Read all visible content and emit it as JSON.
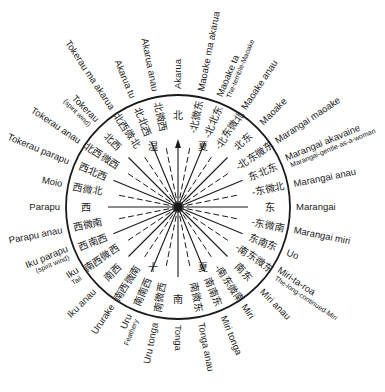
{
  "diagram": {
    "type": "compass-rose",
    "center": {
      "x": 178,
      "y": 207
    },
    "radius": 112,
    "north_arrow": "north-arrow-icon",
    "colors": {
      "ink": "#1a1a1a",
      "background": "#ffffff"
    },
    "points": [
      {
        "angle": 0,
        "cn": "北",
        "mn": "Akarua",
        "sub": ""
      },
      {
        "angle": 11.25,
        "cn": "-北微东",
        "mn": "Maoake ma akarua",
        "sub": ""
      },
      {
        "angle": 22.5,
        "cn": "-北北东",
        "mn": "Maoake ta",
        "sub": "The-terrible-Maoake"
      },
      {
        "angle": 33.75,
        "cn": "-北东微北",
        "mn": "Maoake anau",
        "sub": ""
      },
      {
        "angle": 45,
        "cn": "北东",
        "mn": "Maoake",
        "sub": ""
      },
      {
        "angle": 56.25,
        "cn": "-北东微东",
        "mn": "Marangai maoake",
        "sub": ""
      },
      {
        "angle": 67.5,
        "cn": "东北东",
        "mn": "Marangai akavaine",
        "sub": "Marangai-gentle-as-a-woman"
      },
      {
        "angle": 78.75,
        "cn": "-东微北",
        "mn": "Marangai anau",
        "sub": ""
      },
      {
        "angle": 90,
        "cn": "东",
        "mn": "Marangai",
        "sub": ""
      },
      {
        "angle": 101.25,
        "cn": "-东微南",
        "mn": "Marangai miri",
        "sub": ""
      },
      {
        "angle": 112.5,
        "cn": "东南东",
        "mn": "Uo",
        "sub": ""
      },
      {
        "angle": 123.75,
        "cn": "-南东微东",
        "mn": "Miri-ta-roa",
        "sub": "The-long-continued-Miri"
      },
      {
        "angle": 135,
        "cn": "南东",
        "mn": "Miri anau",
        "sub": ""
      },
      {
        "angle": 146.25,
        "cn": "-南东微南",
        "mn": "Miri",
        "sub": ""
      },
      {
        "angle": 157.5,
        "cn": "南南东",
        "mn": "Miri tonga",
        "sub": ""
      },
      {
        "angle": 168.75,
        "cn": "南微东",
        "mn": "Tonga anau",
        "sub": ""
      },
      {
        "angle": 180,
        "cn": "南",
        "mn": "Tonga",
        "sub": ""
      },
      {
        "angle": 191.25,
        "cn": "南微西",
        "mn": "Uru tonga",
        "sub": ""
      },
      {
        "angle": 202.5,
        "cn": "南南西",
        "mn": "Uru",
        "sub": "Feathery"
      },
      {
        "angle": 213.75,
        "cn": "南西微南",
        "mn": "Ururake",
        "sub": ""
      },
      {
        "angle": 225,
        "cn": "南西",
        "mn": "Iku anau",
        "sub": ""
      },
      {
        "angle": 236.25,
        "cn": "南西微西",
        "mn": "Iku",
        "sub": "Tail"
      },
      {
        "angle": 247.5,
        "cn": "西南西",
        "mn": "Iku parapu",
        "sub": "(spirit wind)"
      },
      {
        "angle": 258.75,
        "cn": "西微南",
        "mn": "Parapu anau",
        "sub": ""
      },
      {
        "angle": 270,
        "cn": "西",
        "mn": "Parapu",
        "sub": ""
      },
      {
        "angle": 281.25,
        "cn": "西微北",
        "mn": "Moio",
        "sub": ""
      },
      {
        "angle": 292.5,
        "cn": "西北西",
        "mn": "Tokerau parapu",
        "sub": ""
      },
      {
        "angle": 303.75,
        "cn": "北西微西",
        "mn": "Tokerau anau",
        "sub": ""
      },
      {
        "angle": 315,
        "cn": "北西",
        "mn": "Tokerau",
        "sub": "(spirit wind)"
      },
      {
        "angle": 326.25,
        "cn": "北西微北",
        "mn": "Tokerau ma akarua",
        "sub": ""
      },
      {
        "angle": 337.5,
        "cn": "北北西",
        "mn": "Akarua tu",
        "sub": ""
      },
      {
        "angle": 348.75,
        "cn": "北微西",
        "mn": "Akarua anau",
        "sub": ""
      }
    ],
    "inner_marks": [
      {
        "angle": 22.5,
        "cn": "夏"
      },
      {
        "angle": 157.5,
        "cn": "夏"
      },
      {
        "angle": 202.5,
        "cn": "十"
      },
      {
        "angle": 337.5,
        "cn": "湿"
      }
    ]
  }
}
